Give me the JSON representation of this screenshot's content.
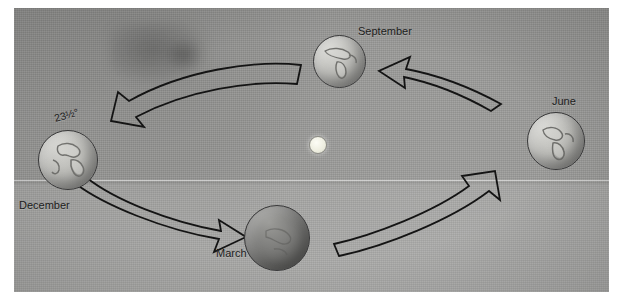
{
  "figure": {
    "type": "astronomy-diagram",
    "background_color": "#9a9a98",
    "ink_color": "#141414"
  },
  "sun": {
    "name": "Sun",
    "color": "#f2f2e6",
    "cx": 317,
    "cy": 144,
    "r": 8
  },
  "labels": {
    "tilt": "23½°",
    "december": "December",
    "march": "March",
    "june": "June",
    "september": "September"
  },
  "globes": [
    {
      "id": "december",
      "label": "December",
      "cx": 68,
      "cy": 152,
      "r": 30,
      "shade": "light",
      "tilt_deg": -23.5
    },
    {
      "id": "march",
      "label": "March",
      "cx": 277,
      "cy": 238,
      "r": 33,
      "shade": "dark",
      "tilt_deg": -23.5
    },
    {
      "id": "june",
      "label": "June",
      "cx": 556,
      "cy": 141,
      "r": 29,
      "shade": "light",
      "tilt_deg": -23.5
    },
    {
      "id": "september",
      "label": "September",
      "cx": 339,
      "cy": 61,
      "r": 26,
      "shade": "light",
      "tilt_deg": -23.5
    }
  ],
  "arrows": [
    {
      "id": "september-to-december",
      "from": "September",
      "to": "December",
      "direction": "left"
    },
    {
      "id": "june-to-september",
      "from": "June",
      "to": "September",
      "direction": "up-left"
    },
    {
      "id": "december-to-march",
      "from": "December",
      "to": "March",
      "direction": "down-right"
    },
    {
      "id": "march-to-june",
      "from": "March",
      "to": "June",
      "direction": "up-right"
    }
  ]
}
